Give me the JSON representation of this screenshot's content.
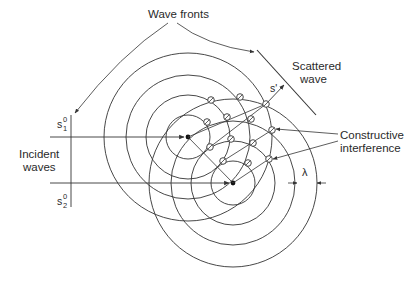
{
  "labels": {
    "wave_fronts": "Wave fronts",
    "scattered_line1": "Scattered",
    "scattered_line2": "wave",
    "constructive_line1": "Constructive",
    "constructive_line2": "interference",
    "incident_line1": "Incident",
    "incident_line2": "waves",
    "s1_base": "s",
    "s1_sup": "0",
    "s1_sub": "1",
    "s2_base": "s",
    "s2_sup": "0",
    "s2_sub": "2",
    "s_prime": "s'",
    "lambda": "λ"
  },
  "geometry": {
    "center1": [
      188,
      137
    ],
    "center2": [
      233,
      183
    ],
    "radii": [
      22,
      42,
      62,
      84
    ],
    "wavelength_px": 20
  },
  "interference_points": [
    [
      211,
      100
    ],
    [
      240,
      97
    ],
    [
      266,
      104
    ],
    [
      207,
      122
    ],
    [
      227,
      117
    ],
    [
      251,
      119
    ],
    [
      272,
      130
    ],
    [
      231,
      139
    ],
    [
      253,
      143
    ],
    [
      210,
      147
    ],
    [
      223,
      161
    ],
    [
      248,
      163
    ],
    [
      269,
      159
    ]
  ],
  "colors": {
    "line": "#333333",
    "text": "#2a2a2a",
    "background": "#ffffff"
  }
}
